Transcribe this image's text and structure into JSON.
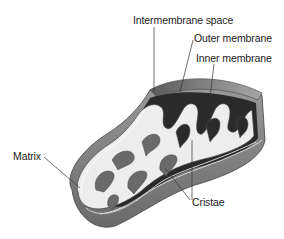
{
  "diagram": {
    "labels": {
      "intermembrane_space": "Intermembrane space",
      "outer_membrane": "Outer membrane",
      "inner_membrane": "Inner membrane",
      "matrix": "Matrix",
      "cristae": "Cristae"
    },
    "colors": {
      "background": "#ffffff",
      "outer_shell": "#8c8c8c",
      "shell_top": "#6e6e6e",
      "dark_interior": "#2a2a2a",
      "matrix_fill": "#ededed",
      "line": "#333333",
      "text": "#222222"
    }
  }
}
